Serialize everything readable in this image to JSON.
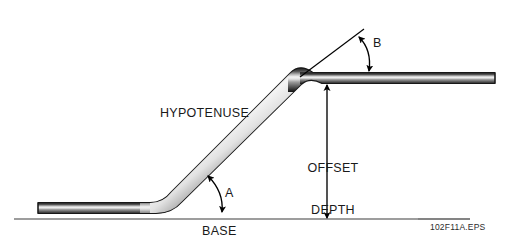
{
  "figure": {
    "figure_id": "102F11A.EPS",
    "labels": {
      "hypotenuse": "HYPOTENUSE",
      "base": "BASE",
      "offset_depth_line1": "OFFSET",
      "offset_depth_line2": "DEPTH",
      "angle_a": "A",
      "angle_b": "B"
    },
    "colors": {
      "tube_dark": "#2e2e2e",
      "tube_mid": "#7a7a7a",
      "tube_highlight": "#f2f2f2",
      "line": "#000000",
      "baseline": "#7d7d7d",
      "background": "#ffffff",
      "text": "#1a1a1a"
    },
    "geometry": {
      "tube_thickness_px": 11,
      "lower_run_y": 208,
      "upper_run_y": 78,
      "lower_run_x_start": 38,
      "lower_run_x_end": 155,
      "upper_run_x_start": 325,
      "upper_run_x_end": 495,
      "baseline_y": 219,
      "baseline_x_start": 14,
      "baseline_x_end": 470,
      "offset_arrow_x": 327,
      "offset_arrow_y_top": 84,
      "offset_arrow_y_bottom": 218,
      "extension_line_from": [
        300,
        76
      ],
      "extension_line_to": [
        364,
        29
      ]
    }
  }
}
